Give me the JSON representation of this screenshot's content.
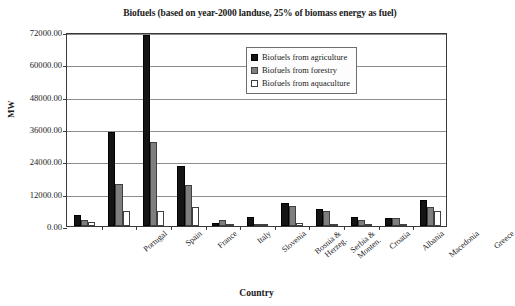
{
  "chart_data": {
    "type": "bar",
    "title": "Biofuels (based on year-2000 landuse, 25% of biomass energy as fuel)",
    "xlabel": "Country",
    "ylabel": "MW",
    "ylim": [
      0,
      72000
    ],
    "ytick_labels": [
      "72000.00",
      "60000.00",
      "48000.00",
      "36000.00",
      "24000.00",
      "12000.00",
      "0.00"
    ],
    "ytick_values": [
      72000,
      60000,
      48000,
      36000,
      24000,
      12000,
      0
    ],
    "grid": true,
    "legend_position": "top-right",
    "categories": [
      "Portugal",
      "Spain",
      "France",
      "Italy",
      "Slovenia",
      "Bosnia &\nHerzeg.",
      "Serbia &\nMonten.",
      "Croatia",
      "Albania",
      "Macedonia",
      "Greece"
    ],
    "series": [
      {
        "name": "Biofuels from agriculture",
        "color": "#141414",
        "values": [
          4100,
          34800,
          71000,
          22300,
          1100,
          3500,
          8600,
          6400,
          3400,
          2900,
          9600
        ]
      },
      {
        "name": "Biofuels from forestry",
        "color": "#7e7e7e",
        "values": [
          2100,
          15600,
          31200,
          15400,
          2100,
          400,
          7600,
          5400,
          2400,
          2900,
          7000
        ]
      },
      {
        "name": "Biofuels from aquaculture",
        "color": "#ffffff",
        "values": [
          1600,
          5600,
          5600,
          7000,
          300,
          300,
          1000,
          900,
          300,
          300,
          5500
        ]
      }
    ]
  }
}
